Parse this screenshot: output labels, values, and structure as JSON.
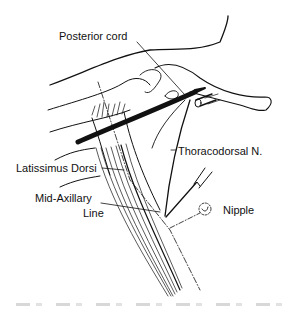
{
  "figure": {
    "type": "anatomical line drawing",
    "labels": {
      "posterior_cord": "Posterior cord",
      "thoracodorsal": "Thoracodorsal N.",
      "latissimus": "Latissimus Dorsi",
      "mid_axillary_1": "Mid-Axillary",
      "mid_axillary_2": "Line",
      "nipple": "Nipple"
    },
    "colors": {
      "ink": "#111111",
      "background": "#ffffff",
      "caption": "#d8d8d8"
    }
  }
}
